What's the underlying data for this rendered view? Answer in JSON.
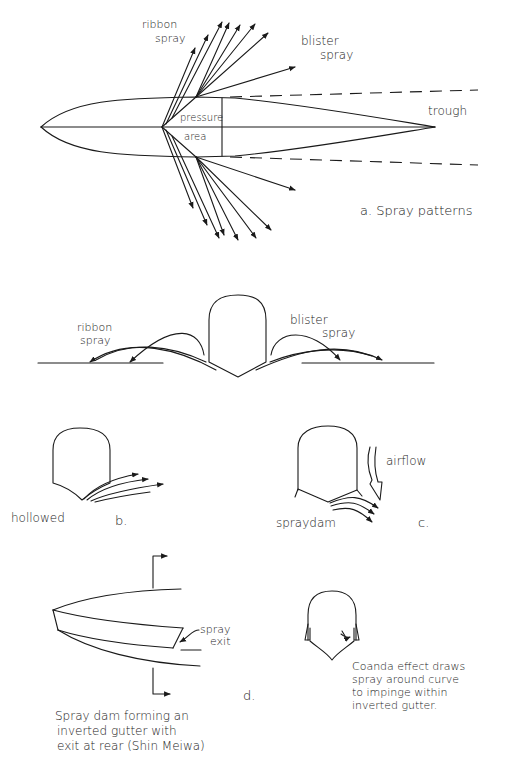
{
  "panel_a": {
    "ribbon_line1": "ribbon",
    "ribbon_line2": "spray",
    "blister_line1": "blister",
    "blister_line2": "spray",
    "pressure_line1": "pressure",
    "pressure_line2": "area",
    "trough": "trough",
    "caption": "a.  Spray patterns"
  },
  "cross_section": {
    "ribbon_line1": "ribbon",
    "ribbon_line2": "spray",
    "blister_line1": "blister",
    "blister_line2": "spray"
  },
  "panel_b": {
    "hull_label": "hollowed",
    "letter": "b."
  },
  "panel_c": {
    "airflow": "airflow",
    "spray_dam": "spraydam",
    "letter": "c."
  },
  "panel_d": {
    "spray_exit_line1": "spray",
    "spray_exit_line2": "exit",
    "letter": "d.",
    "caption_lines": [
      "Spray dam forming an",
      "inverted gutter with",
      "exit at rear (Shin Meiwa)"
    ]
  },
  "coanda": {
    "caption_lines": [
      "Coanda effect draws",
      "spray around curve",
      "to impinge within",
      "inverted gutter."
    ]
  }
}
